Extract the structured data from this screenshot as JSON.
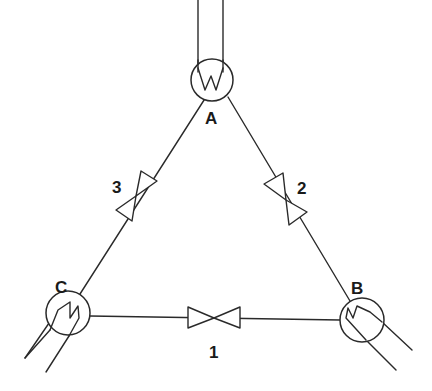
{
  "diagram": {
    "type": "piping-schematic",
    "nodes": [
      {
        "id": "A",
        "label": "A",
        "symbol": "heat-exchanger-w",
        "position": "top"
      },
      {
        "id": "B",
        "label": "B",
        "symbol": "heat-exchanger-coil",
        "position": "bottom-right"
      },
      {
        "id": "C",
        "label": "C",
        "symbol": "heat-exchanger-coil",
        "position": "bottom-left"
      }
    ],
    "valves": [
      {
        "id": "1",
        "label": "1",
        "between": [
          "C",
          "B"
        ],
        "icon": "gate-valve-icon"
      },
      {
        "id": "2",
        "label": "2",
        "between": [
          "A",
          "B"
        ],
        "icon": "gate-valve-icon"
      },
      {
        "id": "3",
        "label": "3",
        "between": [
          "A",
          "C"
        ],
        "icon": "gate-valve-icon"
      }
    ],
    "colors": {
      "line": "#2a2a2a",
      "background": "#ffffff"
    }
  }
}
